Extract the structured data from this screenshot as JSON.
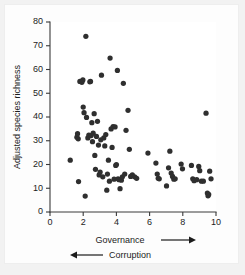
{
  "figure": {
    "background_color": "#f2f2f2",
    "plot_background_color": "#ffffff",
    "point_color": "#2f2f2f",
    "axis_color": "#3a3a3a"
  },
  "labels": {
    "ylabel": "Adjusted species richness",
    "xlabel_primary": "Governance",
    "xlabel_secondary": "Corruption",
    "arrow_right": "→",
    "arrow_left": "←"
  },
  "chart_data": {
    "type": "scatter",
    "title": "",
    "xlabel": "Governance",
    "xlabel_secondary": "Corruption",
    "ylabel": "Adjusted species richness",
    "xlim": [
      0,
      10
    ],
    "ylim": [
      0,
      80
    ],
    "xticks": [
      0,
      2,
      4,
      6,
      8,
      10
    ],
    "yticks": [
      0,
      10,
      20,
      30,
      40,
      50,
      60,
      70,
      80
    ],
    "grid": false,
    "legend": false,
    "marker": "circle",
    "marker_size": 4.2,
    "points": [
      [
        1.22,
        21.8
      ],
      [
        1.62,
        31.5
      ],
      [
        1.66,
        33.0
      ],
      [
        1.7,
        30.8
      ],
      [
        1.72,
        12.8
      ],
      [
        1.8,
        55.0
      ],
      [
        1.92,
        54.6
      ],
      [
        1.98,
        55.6
      ],
      [
        2.0,
        44.2
      ],
      [
        2.05,
        41.8
      ],
      [
        2.12,
        6.7
      ],
      [
        2.16,
        74.0
      ],
      [
        2.2,
        39.8
      ],
      [
        2.28,
        31.2
      ],
      [
        2.34,
        32.4
      ],
      [
        2.4,
        54.8
      ],
      [
        2.44,
        55.0
      ],
      [
        2.48,
        32.2
      ],
      [
        2.52,
        37.6
      ],
      [
        2.56,
        29.6
      ],
      [
        2.6,
        33.2
      ],
      [
        2.66,
        41.4
      ],
      [
        2.7,
        23.8
      ],
      [
        2.74,
        18.0
      ],
      [
        2.8,
        31.8
      ],
      [
        2.86,
        38.2
      ],
      [
        2.92,
        28.2
      ],
      [
        2.96,
        15.6
      ],
      [
        3.02,
        16.8
      ],
      [
        3.06,
        30.4
      ],
      [
        3.1,
        57.6
      ],
      [
        3.18,
        14.8
      ],
      [
        3.24,
        31.2
      ],
      [
        3.3,
        27.8
      ],
      [
        3.36,
        32.6
      ],
      [
        3.42,
        9.2
      ],
      [
        3.46,
        16.0
      ],
      [
        3.52,
        21.8
      ],
      [
        3.58,
        13.0
      ],
      [
        3.62,
        64.8
      ],
      [
        3.68,
        35.0
      ],
      [
        3.74,
        27.2
      ],
      [
        3.8,
        36.0
      ],
      [
        3.86,
        13.8
      ],
      [
        3.92,
        35.8
      ],
      [
        3.96,
        19.6
      ],
      [
        4.0,
        20.0
      ],
      [
        4.06,
        59.6
      ],
      [
        4.1,
        14.0
      ],
      [
        4.16,
        13.6
      ],
      [
        4.22,
        9.8
      ],
      [
        4.3,
        13.4
      ],
      [
        4.36,
        14.8
      ],
      [
        4.42,
        54.2
      ],
      [
        4.5,
        16.0
      ],
      [
        4.58,
        34.4
      ],
      [
        4.7,
        42.8
      ],
      [
        4.78,
        26.4
      ],
      [
        4.86,
        15.0
      ],
      [
        4.96,
        15.6
      ],
      [
        5.1,
        14.8
      ],
      [
        5.22,
        14.2
      ],
      [
        5.9,
        24.8
      ],
      [
        6.38,
        20.6
      ],
      [
        6.46,
        16.0
      ],
      [
        6.52,
        14.2
      ],
      [
        6.58,
        14.0
      ],
      [
        7.02,
        11.0
      ],
      [
        7.14,
        18.6
      ],
      [
        7.22,
        25.6
      ],
      [
        7.3,
        16.4
      ],
      [
        7.38,
        15.0
      ],
      [
        7.46,
        13.8
      ],
      [
        7.54,
        14.0
      ],
      [
        7.9,
        20.2
      ],
      [
        7.98,
        18.2
      ],
      [
        8.52,
        19.6
      ],
      [
        8.6,
        14.0
      ],
      [
        8.68,
        13.2
      ],
      [
        8.84,
        13.6
      ],
      [
        8.96,
        19.2
      ],
      [
        9.02,
        17.4
      ],
      [
        9.12,
        13.0
      ],
      [
        9.24,
        13.0
      ],
      [
        9.4,
        41.6
      ],
      [
        9.48,
        8.0
      ],
      [
        9.52,
        6.8
      ],
      [
        9.56,
        7.4
      ],
      [
        9.62,
        17.2
      ],
      [
        9.7,
        14.0
      ]
    ]
  }
}
